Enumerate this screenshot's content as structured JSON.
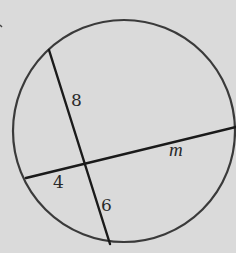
{
  "diagram": {
    "type": "geometry-intersecting-chords",
    "circle": {
      "cx": 125,
      "cy": 131,
      "rx": 110,
      "ry": 114,
      "stroke": "#3a3a3a"
    },
    "chords": [
      {
        "name": "chord-a",
        "x1": 49,
        "y1": 50,
        "x2": 110,
        "y2": 244,
        "stroke": "#1a1a1a"
      },
      {
        "name": "chord-b",
        "x1": 26,
        "y1": 178,
        "x2": 236,
        "y2": 127,
        "stroke": "#1a1a1a"
      }
    ],
    "intersection": {
      "x": 85,
      "y": 163
    },
    "labels": {
      "upper_segment": "8",
      "left_segment": "4",
      "lower_segment": "6",
      "right_segment": "m"
    },
    "colors": {
      "background": "#dadada",
      "ink": "#1a1a1a",
      "circle": "#3a3a3a"
    }
  }
}
